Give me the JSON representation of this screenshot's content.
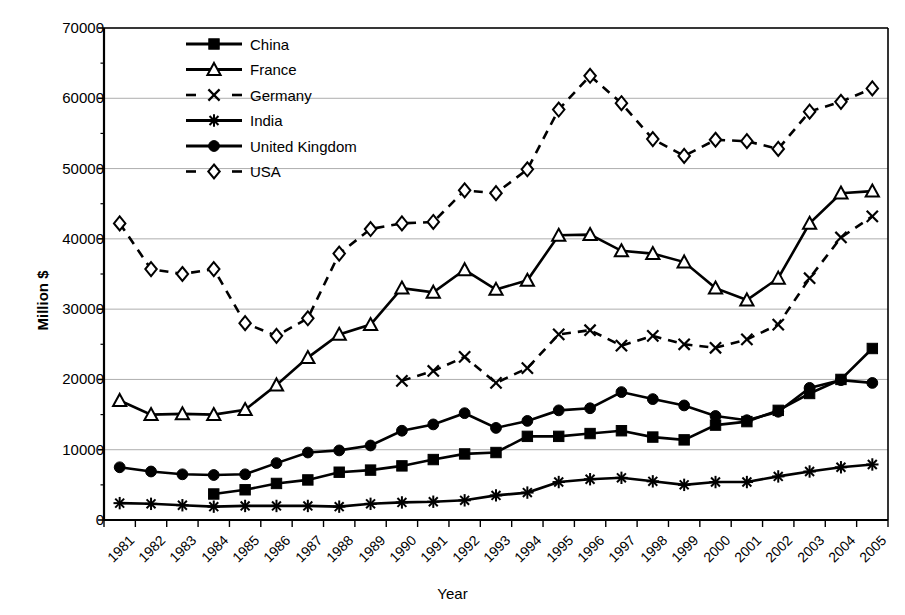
{
  "chart_data": {
    "type": "line",
    "title": "",
    "xlabel": "Year",
    "ylabel": "Million $",
    "ylim": [
      0,
      70000
    ],
    "ytick_labels": [
      "0",
      "10000",
      "20000",
      "30000",
      "40000",
      "50000",
      "60000",
      "70000"
    ],
    "yticks": [
      0,
      10000,
      20000,
      30000,
      40000,
      50000,
      60000,
      70000
    ],
    "grid": "horizontal",
    "legend_position": "top-left-inside",
    "x": [
      1981,
      1982,
      1983,
      1984,
      1985,
      1986,
      1987,
      1988,
      1989,
      1990,
      1991,
      1992,
      1993,
      1994,
      1995,
      1996,
      1997,
      1998,
      1999,
      2000,
      2001,
      2002,
      2003,
      2004,
      2005
    ],
    "categories": [
      "1981",
      "1982",
      "1983",
      "1984",
      "1985",
      "1986",
      "1987",
      "1988",
      "1989",
      "1990",
      "1991",
      "1992",
      "1993",
      "1994",
      "1995",
      "1996",
      "1997",
      "1998",
      "1999",
      "2000",
      "2001",
      "2002",
      "2003",
      "2004",
      "2005"
    ],
    "series": [
      {
        "name": "China",
        "marker": "filled-square",
        "linestyle": "solid",
        "values": [
          null,
          null,
          null,
          3700,
          4300,
          5200,
          5700,
          6800,
          7100,
          7700,
          8600,
          9400,
          9600,
          11900,
          11900,
          12300,
          12700,
          11800,
          11400,
          13500,
          14000,
          15600,
          18000,
          20000,
          24400
        ]
      },
      {
        "name": "France",
        "marker": "open-triangle",
        "linestyle": "solid",
        "values": [
          17000,
          15000,
          15100,
          15000,
          15700,
          19200,
          23100,
          26400,
          27800,
          33000,
          32400,
          35600,
          32800,
          34100,
          40500,
          40600,
          38300,
          37900,
          36700,
          33000,
          31300,
          34400,
          42200,
          46500,
          46800
        ]
      },
      {
        "name": "Germany",
        "marker": "x-cross",
        "linestyle": "dashed",
        "values": [
          null,
          null,
          null,
          null,
          null,
          null,
          null,
          null,
          null,
          19800,
          21200,
          23200,
          19500,
          21600,
          26400,
          27000,
          24800,
          26200,
          25000,
          24500,
          25700,
          27800,
          34400,
          40200,
          43200
        ]
      },
      {
        "name": "India",
        "marker": "asterisk",
        "linestyle": "solid",
        "values": [
          2400,
          2300,
          2100,
          1900,
          2000,
          2000,
          2000,
          1900,
          2300,
          2500,
          2600,
          2800,
          3500,
          3900,
          5400,
          5800,
          6000,
          5500,
          5000,
          5400,
          5400,
          6200,
          6900,
          7500,
          7900
        ]
      },
      {
        "name": "United Kingdom",
        "marker": "filled-circle",
        "linestyle": "solid",
        "values": [
          7500,
          6900,
          6500,
          6400,
          6500,
          8100,
          9600,
          9900,
          10600,
          12700,
          13600,
          15200,
          13100,
          14100,
          15600,
          15900,
          18200,
          17200,
          16300,
          14800,
          14200,
          15400,
          18800,
          19900,
          19500
        ]
      },
      {
        "name": "USA",
        "marker": "open-diamond",
        "linestyle": "dashed",
        "values": [
          42200,
          35700,
          35000,
          35700,
          28000,
          26200,
          28700,
          37900,
          41400,
          42200,
          42400,
          46900,
          46500,
          49900,
          58400,
          63200,
          59300,
          54200,
          51800,
          54100,
          53900,
          52800,
          58100,
          59500,
          61400
        ]
      }
    ]
  },
  "axes": {
    "y_axis_title": "Million $",
    "x_axis_title": "Year"
  },
  "legend": {
    "items": [
      {
        "label": "China"
      },
      {
        "label": "France"
      },
      {
        "label": "Germany"
      },
      {
        "label": "India"
      },
      {
        "label": "United Kingdom"
      },
      {
        "label": "USA"
      }
    ]
  },
  "colors": {
    "line": "#000000",
    "grid": "#999999",
    "axis": "#000000",
    "background": "#ffffff"
  }
}
